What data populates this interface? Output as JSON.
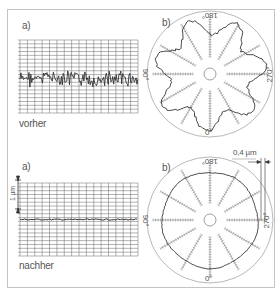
{
  "chart_data": [
    {
      "type": "line",
      "panel": "a)",
      "caption": "vorher",
      "title": "Linear roughness profile before",
      "grid": true,
      "xlabel": "",
      "ylabel": "",
      "description": "Noisy profile trace with large amplitude deviations"
    },
    {
      "type": "polar",
      "panel": "b)",
      "title": "Roundness plot before",
      "angle_labels": [
        "180°",
        "90°",
        "270°",
        "0°"
      ],
      "description": "Irregular lobed (~7 lobes) roundness profile"
    },
    {
      "type": "line",
      "panel": "a)",
      "caption": "nachher",
      "scale_label": "1 µm",
      "grid": true,
      "description": "Nearly flat profile trace after processing"
    },
    {
      "type": "polar",
      "panel": "b)",
      "title": "Roundness plot after",
      "angle_labels": [
        "180°",
        "90°",
        "270°",
        "0°"
      ],
      "scale_label": "0,4 µm",
      "description": "Nearly circular roundness profile"
    }
  ],
  "top": {
    "linear_label": "a)",
    "caption": "vorher",
    "polar_label": "b)",
    "angle_top": "180°",
    "angle_left": "90°",
    "angle_right": "270°",
    "angle_bottom": "0°"
  },
  "bottom": {
    "linear_label": "a)",
    "caption": "nachher",
    "scale_label": "1 µm",
    "polar_label": "b)",
    "angle_top": "180°",
    "angle_left": "90°",
    "angle_right": "270°",
    "angle_bottom": "0°",
    "polar_scale": "0,4 µm"
  },
  "colors": {
    "trace": "#333333",
    "grid": "#555555",
    "frame": "#c4c4c4",
    "circle": "#888888"
  }
}
